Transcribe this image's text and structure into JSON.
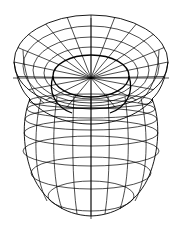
{
  "figure": {
    "subtitle": "Polar view mesh",
    "background_color": "#ffffff",
    "stroke_color": "#000000",
    "canvas": {
      "width": 181,
      "height": 231
    }
  },
  "geometry": {
    "type": "surface-of-revolution-wireframe",
    "projection": "oblique-polar",
    "pole": {
      "x": 91,
      "y": 78
    },
    "axis_x": 91,
    "waist": {
      "y": 100,
      "left_x": 30,
      "right_x": 152
    },
    "top_cap": {
      "description": "concentric ellipses around north pole with radial meridian spokes",
      "center_x": 91,
      "center_y": 78,
      "rings": [
        {
          "rx": 38,
          "ry": 21,
          "cy": 76,
          "weight": "bold"
        },
        {
          "rx": 47,
          "ry": 26,
          "cy": 73,
          "weight": "thin"
        },
        {
          "rx": 58,
          "ry": 33,
          "cy": 70,
          "weight": "thin"
        },
        {
          "rx": 68,
          "ry": 40,
          "cy": 66,
          "weight": "thin"
        },
        {
          "rx": 77,
          "ry": 47,
          "cy": 62,
          "weight": "mid"
        }
      ],
      "spoke_count": 18,
      "spoke_rx": 77,
      "spoke_ry": 47,
      "spoke_cy": 62
    },
    "lower_body": {
      "description": "spheroid body with latitude rings and longitude meridians",
      "center_x": 91,
      "top_y": 96,
      "bottom_y": 216,
      "max_half_width": 68,
      "widest_y": 152,
      "latitude_rings": [
        {
          "cy": 101,
          "rx": 62,
          "ry": 7
        },
        {
          "cy": 109,
          "rx": 64,
          "ry": 9
        },
        {
          "cy": 119,
          "rx": 66,
          "ry": 11
        },
        {
          "cy": 133,
          "rx": 67,
          "ry": 13
        },
        {
          "cy": 151,
          "rx": 68,
          "ry": 15
        },
        {
          "cy": 173,
          "rx": 60,
          "ry": 16
        },
        {
          "cy": 196,
          "rx": 43,
          "ry": 15
        }
      ],
      "longitude_offsets": [
        0,
        17,
        34,
        51,
        68
      ],
      "meridian_count": 9
    },
    "equator_line": {
      "y": 78,
      "x_start": 13,
      "x_end": 169
    },
    "polar_axis": {
      "x": 91,
      "y_start": 18,
      "y_end": 219
    }
  },
  "labels": {
    "figure_caption": ""
  }
}
